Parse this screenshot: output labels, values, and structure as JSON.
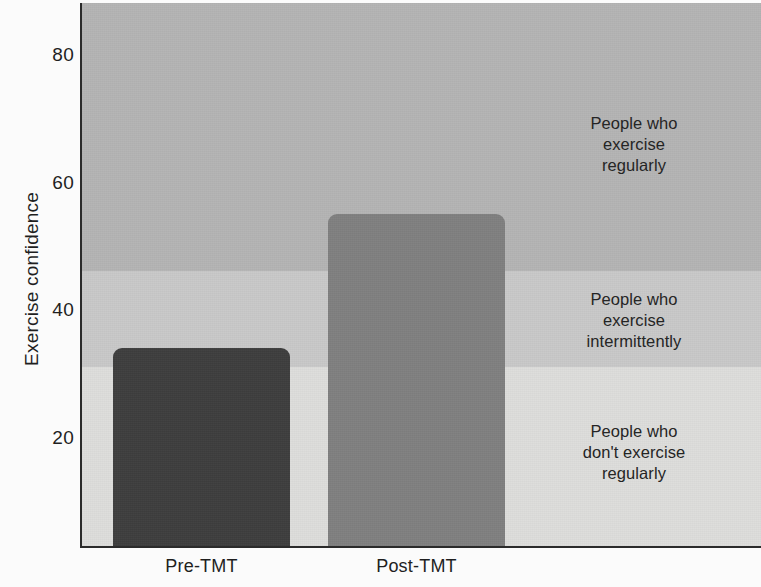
{
  "chart_data": {
    "type": "bar",
    "title": "",
    "xlabel": "",
    "ylabel": "Exercise confidence",
    "categories": [
      "Pre-TMT",
      "Post-TMT"
    ],
    "values": [
      31,
      52
    ],
    "ylim": [
      0,
      85
    ],
    "yticks": [
      20,
      40,
      60,
      80
    ],
    "ytick_labels": [
      "20",
      "40",
      "60",
      "80"
    ],
    "grid": false,
    "legend": "none",
    "bar_colors": [
      "#3e3e3e",
      "#808080"
    ],
    "bands": [
      {
        "name": "regular",
        "label_line1": "People who",
        "label_line2": "exercise",
        "label_line3": "regularly",
        "range": [
          43,
          85
        ],
        "color": "#b4b4b4"
      },
      {
        "name": "intermittent",
        "label_line1": "People who",
        "label_line2": "exercise",
        "label_line3": "intermittently",
        "range": [
          28,
          43
        ],
        "color": "#c9c9c9"
      },
      {
        "name": "non-exercise",
        "label_line1": "People who",
        "label_line2": "don't exercise",
        "label_line3": "regularly",
        "range": [
          0,
          28
        ],
        "color": "#dededc"
      }
    ]
  },
  "axis": {
    "y_label": "Exercise confidence",
    "y_ticks": [
      "80",
      "60",
      "40",
      "20"
    ],
    "x_ticks": [
      "Pre-TMT",
      "Post-TMT"
    ]
  },
  "annotations": {
    "regular": {
      "line1": "People who",
      "line2": "exercise",
      "line3": "regularly"
    },
    "intermittent": {
      "line1": "People who",
      "line2": "exercise",
      "line3": "intermittently"
    },
    "non_exercise": {
      "line1": "People who",
      "line2": "don't exercise",
      "line3": "regularly"
    }
  }
}
